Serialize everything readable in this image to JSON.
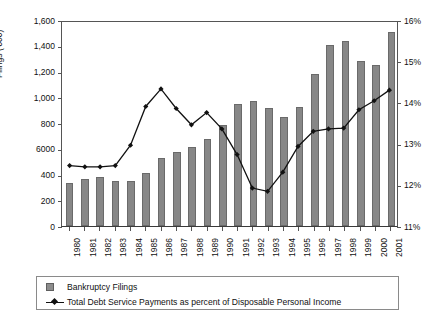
{
  "chart_data": {
    "type": "bar",
    "title": "",
    "xlabel": "",
    "ylabel": "Filings ('000)",
    "ylabel_right": "",
    "categories": [
      "1980",
      "1981",
      "1982",
      "1983",
      "1984",
      "1985",
      "1986",
      "1987",
      "1988",
      "1989",
      "1990",
      "1991",
      "1992",
      "1993",
      "1994",
      "1995",
      "1996",
      "1997",
      "1998",
      "1999",
      "2000",
      "2001"
    ],
    "ylim": [
      0,
      1600
    ],
    "ylim_right": [
      11,
      16
    ],
    "ytick_labels": [
      "0",
      "200",
      "400",
      "6000",
      "800",
      "1,000",
      "1,200",
      "1,400",
      "1,600"
    ],
    "ytick_values": [
      0,
      200,
      400,
      600,
      800,
      1000,
      1200,
      1400,
      1600
    ],
    "ytick_labels_right": [
      "11%",
      "12%",
      "13%",
      "14%",
      "15%",
      "16%"
    ],
    "ytick_values_right": [
      11,
      12,
      13,
      14,
      15,
      16
    ],
    "grid": false,
    "legend_position": "bottom",
    "series": [
      {
        "name": "Bankruptcy Filings",
        "type": "bar",
        "axis": "left",
        "color": "#878787",
        "values": [
          331,
          363,
          381,
          349,
          350,
          412,
          530,
          577,
          613,
          679,
          783,
          944,
          972,
          919,
          846,
          927,
          1179,
          1404,
          1437,
          1282,
          1253,
          1505
        ]
      },
      {
        "name": "Total Debt Service Payments as percent of Disposable Personal Income",
        "type": "line",
        "axis": "right",
        "color": "#111111",
        "values": [
          12.48,
          12.45,
          12.45,
          12.48,
          12.98,
          13.93,
          14.36,
          13.88,
          13.48,
          13.78,
          13.38,
          12.75,
          11.93,
          11.85,
          12.32,
          12.95,
          13.32,
          13.38,
          13.4,
          13.85,
          14.07,
          14.33
        ]
      }
    ]
  },
  "legend": {
    "items": [
      {
        "label": "Bankruptcy Filings",
        "marker": "bar-swatch"
      },
      {
        "label": "Total Debt Service Payments as percent of Disposable Personal Income",
        "marker": "line-marker"
      }
    ]
  }
}
